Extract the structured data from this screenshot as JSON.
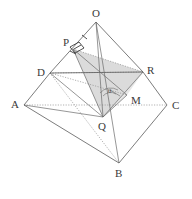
{
  "figure": {
    "kind": "3d-geometry-diagram",
    "background_color": "#ffffff",
    "line_color": "#5a5a5a",
    "hidden_line_color": "#8f8f8f",
    "shade_color": "#cfcfcf",
    "label_color": "#3a3a3a",
    "corner_artifact": "",
    "vertices": [
      {
        "id": "O",
        "label": "O",
        "x": 96,
        "y": 22,
        "label_x": 92,
        "label_y": 17
      },
      {
        "id": "A",
        "label": "A",
        "x": 24,
        "y": 105,
        "label_x": 11,
        "label_y": 108
      },
      {
        "id": "B",
        "label": "B",
        "x": 119,
        "y": 163,
        "label_x": 115,
        "label_y": 177
      },
      {
        "id": "C",
        "label": "C",
        "x": 167,
        "y": 105,
        "label_x": 172,
        "label_y": 109
      },
      {
        "id": "D",
        "label": "D",
        "x": 50,
        "y": 73,
        "label_x": 37,
        "label_y": 76
      },
      {
        "id": "P",
        "label": "P",
        "x": 73,
        "y": 49,
        "label_x": 63,
        "label_y": 46
      },
      {
        "id": "R",
        "label": "R",
        "x": 143,
        "y": 72,
        "label_x": 147,
        "label_y": 74
      },
      {
        "id": "Q",
        "label": "Q",
        "x": 103,
        "y": 117,
        "label_x": 98,
        "label_y": 130
      },
      {
        "id": "M",
        "label": "M",
        "x": 127,
        "y": 95,
        "label_x": 131,
        "label_y": 104
      }
    ],
    "angle_label": "θ",
    "angle_label_x": 108,
    "angle_label_y": 93,
    "markers": [
      {
        "id": "right-angle-at-p",
        "type": "right-angle",
        "at": "P"
      },
      {
        "id": "angle-theta-at-m",
        "type": "arc",
        "at": "M"
      }
    ]
  }
}
